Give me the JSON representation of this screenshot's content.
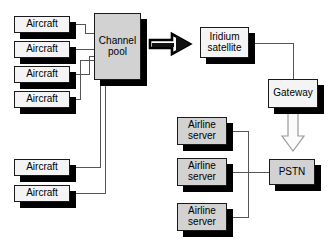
{
  "diagram": {
    "type": "block-flow-diagram",
    "colors": {
      "node_light_fill": "#f4f4f4",
      "node_gray_fill": "#d2d2d2",
      "outline": "#1a1a1a",
      "shadow": "#000000",
      "wire": "#4d4d4d",
      "background": "#ffffff"
    },
    "nodes": [
      {
        "id": "aircraft-1",
        "label": "Aircraft",
        "group": "aircraft-upper",
        "fill": "light",
        "x": 14,
        "y": 16,
        "w": 56,
        "h": 17
      },
      {
        "id": "aircraft-2",
        "label": "Aircraft",
        "group": "aircraft-upper",
        "fill": "light",
        "x": 14,
        "y": 41,
        "w": 56,
        "h": 17
      },
      {
        "id": "aircraft-3",
        "label": "Aircraft",
        "group": "aircraft-upper",
        "fill": "light",
        "x": 14,
        "y": 66,
        "w": 56,
        "h": 17
      },
      {
        "id": "aircraft-4",
        "label": "Aircraft",
        "group": "aircraft-upper",
        "fill": "light",
        "x": 14,
        "y": 91,
        "w": 56,
        "h": 17
      },
      {
        "id": "aircraft-5",
        "label": "Aircraft",
        "group": "aircraft-lower",
        "fill": "light",
        "x": 14,
        "y": 159,
        "w": 56,
        "h": 17
      },
      {
        "id": "aircraft-6",
        "label": "Aircraft",
        "group": "aircraft-lower",
        "fill": "light",
        "x": 14,
        "y": 185,
        "w": 56,
        "h": 17
      },
      {
        "id": "channel-pool",
        "label": "Channel\npool",
        "group": "core",
        "fill": "gray",
        "x": 94,
        "y": 13,
        "w": 47,
        "h": 67
      },
      {
        "id": "iridium-satellite",
        "label": "Iridium\nsatellite",
        "group": "space",
        "fill": "light",
        "x": 200,
        "y": 27,
        "w": 49,
        "h": 31
      },
      {
        "id": "gateway",
        "label": "Gateway",
        "group": "ground",
        "fill": "light",
        "x": 268,
        "y": 79,
        "w": 50,
        "h": 29
      },
      {
        "id": "pstn",
        "label": "PSTN",
        "group": "ground",
        "fill": "gray",
        "x": 269,
        "y": 159,
        "w": 46,
        "h": 26
      },
      {
        "id": "airline-server-1",
        "label": "Airline\nserver",
        "group": "airline",
        "fill": "gray",
        "x": 177,
        "y": 117,
        "w": 50,
        "h": 28
      },
      {
        "id": "airline-server-2",
        "label": "Airline\nserver",
        "group": "airline",
        "fill": "gray",
        "x": 177,
        "y": 158,
        "w": 50,
        "h": 28
      },
      {
        "id": "airline-server-3",
        "label": "Airline\nserver",
        "group": "airline",
        "fill": "gray",
        "x": 177,
        "y": 203,
        "w": 50,
        "h": 28
      }
    ],
    "arrows": [
      {
        "id": "channel-pool-to-iridium",
        "style": "block-arrow-right",
        "from": "channel-pool",
        "to": "iridium-satellite"
      },
      {
        "id": "gateway-to-pstn",
        "style": "hollow-arrow-down",
        "from": "gateway",
        "to": "pstn"
      }
    ],
    "connections": [
      {
        "from": "aircraft-1",
        "to": "channel-pool"
      },
      {
        "from": "aircraft-2",
        "to": "channel-pool"
      },
      {
        "from": "aircraft-3",
        "to": "channel-pool"
      },
      {
        "from": "aircraft-4",
        "to": "channel-pool"
      },
      {
        "from": "aircraft-5",
        "to": "channel-pool"
      },
      {
        "from": "aircraft-6",
        "to": "channel-pool"
      },
      {
        "from": "iridium-satellite",
        "to": "gateway"
      },
      {
        "from": "airline-server-1",
        "to": "pstn"
      },
      {
        "from": "airline-server-2",
        "to": "pstn"
      },
      {
        "from": "airline-server-3",
        "to": "pstn"
      }
    ]
  }
}
